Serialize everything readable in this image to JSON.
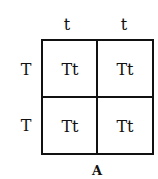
{
  "punnett_square": {
    "column_alleles": [
      "t",
      "t"
    ],
    "row_alleles": [
      "T",
      "T"
    ],
    "cells": [
      [
        "Tt",
        "Tt"
      ],
      [
        "Tt",
        "Tt"
      ]
    ],
    "caption": "A",
    "line_color": "#111111"
  }
}
